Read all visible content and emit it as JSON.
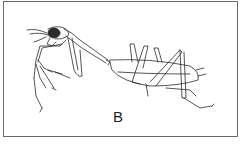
{
  "figure": {
    "panel_label": "B",
    "colors": {
      "line": "#2a2a2a",
      "border": "#6a6a6a",
      "background": "#ffffff"
    }
  }
}
